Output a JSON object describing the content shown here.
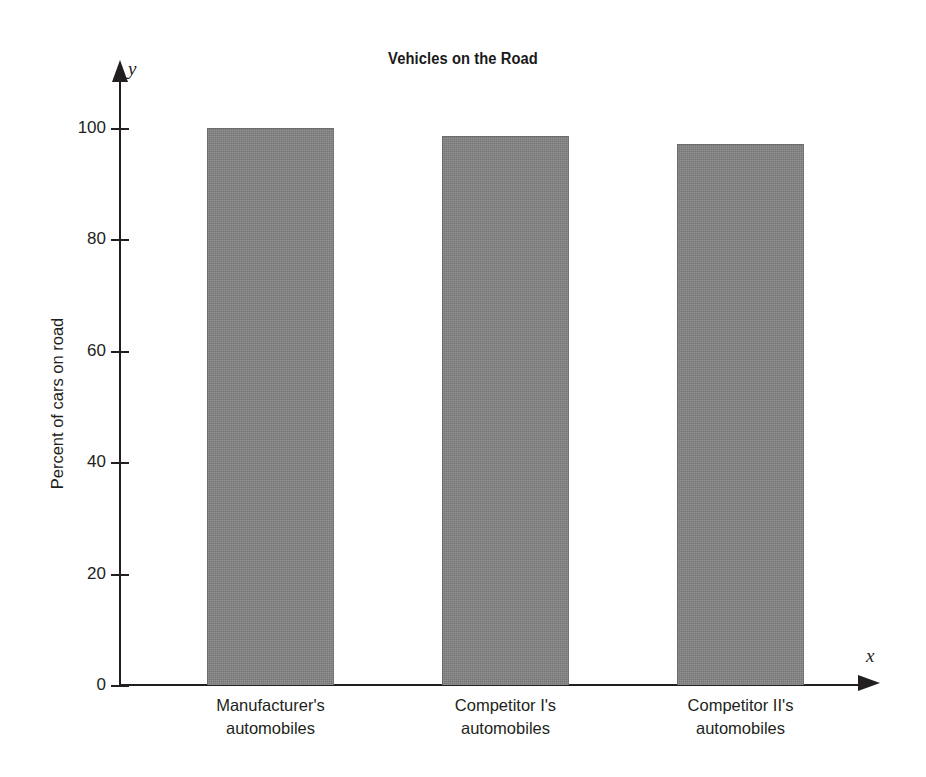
{
  "chart_data": {
    "type": "bar",
    "title": "Vehicles on the Road",
    "xlabel": "",
    "ylabel": "Percent of cars on road",
    "categories": [
      "Manufacturer's automobiles",
      "Competitor I's automobiles",
      "Competitor II's automobiles"
    ],
    "category_lines": [
      [
        "Manufacturer's",
        "automobiles"
      ],
      [
        "Competitor I's",
        "automobiles"
      ],
      [
        "Competitor II's",
        "automobiles"
      ]
    ],
    "values": [
      100,
      98.5,
      97.2
    ],
    "ylim": [
      0,
      110
    ],
    "yticks": [
      0,
      20,
      40,
      60,
      80,
      100
    ],
    "ytick_labels": [
      "0",
      "20",
      "40",
      "60",
      "80",
      "100"
    ],
    "grid": false,
    "legend": null,
    "axis_names": {
      "x": "x",
      "y": "y"
    },
    "bar_color": "#828282",
    "axis_color": "#231f20",
    "background": "#ffffff"
  }
}
